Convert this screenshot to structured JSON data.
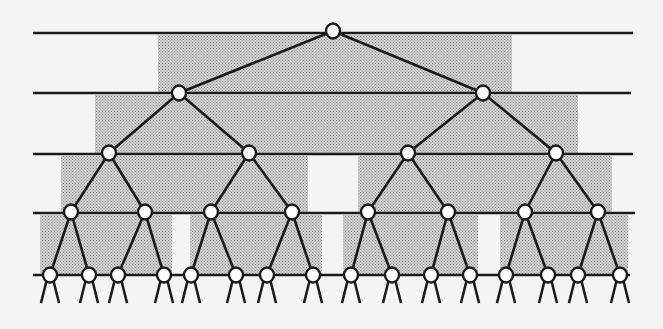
{
  "diagram": {
    "type": "binary-tree-with-shaded-bands",
    "colors": {
      "background": "#f4f4f4",
      "shade": "#b9b9b9",
      "line": "#1a1a1a",
      "node_fill": "#ffffff",
      "node_stroke": "#1a1a1a"
    },
    "levels_y": [
      33,
      93,
      154,
      213,
      275
    ],
    "level_line_x": [
      [
        33,
        633
      ],
      [
        33,
        631
      ],
      [
        33,
        633
      ],
      [
        33,
        635
      ],
      [
        33,
        630
      ]
    ],
    "shaded_bands": [
      {
        "level": 0,
        "x": 158,
        "y": 35,
        "w": 354,
        "h": 58
      },
      {
        "level": 1,
        "x": 95,
        "y": 95,
        "w": 483,
        "h": 59
      },
      {
        "level": 2,
        "x": 61,
        "y": 156,
        "w": 247,
        "h": 57
      },
      {
        "level": 2,
        "x": 358,
        "y": 156,
        "w": 254,
        "h": 57
      },
      {
        "level": 3,
        "x": 40,
        "y": 215,
        "w": 132,
        "h": 60
      },
      {
        "level": 3,
        "x": 190,
        "y": 215,
        "w": 132,
        "h": 60
      },
      {
        "level": 3,
        "x": 343,
        "y": 215,
        "w": 135,
        "h": 60
      },
      {
        "level": 3,
        "x": 500,
        "y": 215,
        "w": 128,
        "h": 60
      }
    ],
    "nodes": {
      "level0": [
        [
          333,
          31
        ]
      ],
      "level1": [
        [
          179,
          93
        ],
        [
          483,
          93
        ]
      ],
      "level2": [
        [
          109,
          153
        ],
        [
          249,
          153
        ],
        [
          408,
          153
        ],
        [
          556,
          153
        ]
      ],
      "level3": [
        [
          71,
          212
        ],
        [
          145,
          212
        ],
        [
          211,
          212
        ],
        [
          292,
          212
        ],
        [
          368,
          212
        ],
        [
          448,
          212
        ],
        [
          525,
          212
        ],
        [
          598,
          212
        ]
      ],
      "level4": [
        [
          50,
          275
        ],
        [
          89,
          275
        ],
        [
          118,
          275
        ],
        [
          164,
          275
        ],
        [
          191,
          275
        ],
        [
          236,
          275
        ],
        [
          267,
          275
        ],
        [
          313,
          275
        ],
        [
          351,
          275
        ],
        [
          392,
          275
        ],
        [
          431,
          275
        ],
        [
          470,
          275
        ],
        [
          506,
          275
        ],
        [
          548,
          275
        ],
        [
          578,
          275
        ],
        [
          620,
          275
        ]
      ]
    },
    "leaf_stub_length": 28,
    "leaf_stub_spread": 9
  }
}
